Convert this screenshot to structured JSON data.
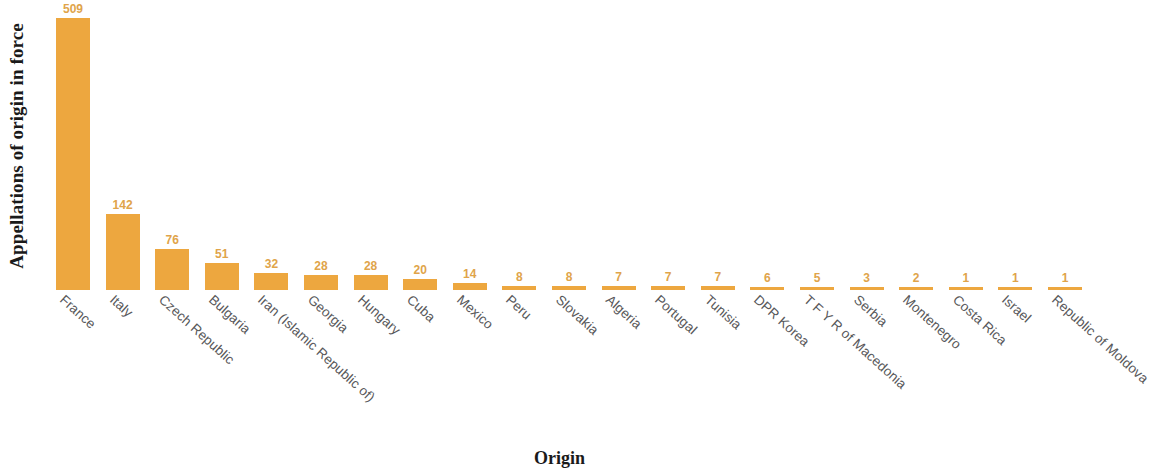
{
  "chart_data": {
    "type": "bar",
    "title": "",
    "xlabel": "Origin",
    "ylabel": "Appellations of origin in force",
    "categories": [
      "France",
      "Italy",
      "Czech Republic",
      "Bulgaria",
      "Iran (Islamic Republic of)",
      "Georgia",
      "Hungary",
      "Cuba",
      "Mexico",
      "Peru",
      "Slovakia",
      "Algeria",
      "Portugal",
      "Tunisia",
      "DPR Korea",
      "T F Y R of Macedonia",
      "Serbia",
      "Montenegro",
      "Costa Rica",
      "Israel",
      "Republic of Moldova"
    ],
    "values": [
      509,
      142,
      76,
      51,
      32,
      28,
      28,
      20,
      14,
      8,
      8,
      7,
      7,
      7,
      6,
      5,
      3,
      2,
      1,
      1,
      1
    ],
    "value_labels": [
      "509",
      "142",
      "76",
      "51",
      "32",
      "28",
      "28",
      "20",
      "14",
      "8",
      "8",
      "7",
      "7",
      "7",
      "6",
      "5",
      "3",
      "2",
      "1",
      "1",
      "1"
    ],
    "ylim": [
      0,
      509
    ],
    "grid": false,
    "legend": null,
    "bar_color": "#eda73f",
    "value_label_color": "#e0a44a",
    "category_label_color": "#58585a",
    "axis_title_color": "#1a1a1a"
  },
  "axes": {
    "y_title": "Appellations of origin in force",
    "x_title": "Origin"
  }
}
